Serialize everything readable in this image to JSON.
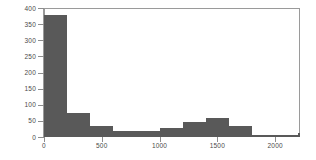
{
  "chart_data": {
    "type": "bar",
    "title": "",
    "subtitle": "",
    "xlabel": "",
    "ylabel": "",
    "grid": false,
    "legend": null,
    "orientation": "vertical",
    "histogram": true,
    "bin_width": 200,
    "xlim": [
      0,
      2215
    ],
    "ylim": [
      0,
      400
    ],
    "xticks": [
      0,
      500,
      1000,
      1500,
      2000
    ],
    "xtick_labels": [
      "0",
      "500",
      "1000",
      "1500",
      "2000"
    ],
    "yticks": [
      0,
      50,
      100,
      150,
      200,
      250,
      300,
      350,
      400
    ],
    "ytick_labels": [
      "0",
      "50",
      "100",
      "150",
      "200",
      "250",
      "300",
      "350",
      "400"
    ],
    "bin_edges": [
      0,
      200,
      400,
      600,
      800,
      1000,
      1200,
      1400,
      1600,
      1800,
      2000,
      2200
    ],
    "bars": [
      {
        "x0": 0,
        "x1": 200,
        "value": 378
      },
      {
        "x0": 200,
        "x1": 400,
        "value": 74
      },
      {
        "x0": 400,
        "x1": 600,
        "value": 34
      },
      {
        "x0": 600,
        "x1": 800,
        "value": 19
      },
      {
        "x0": 800,
        "x1": 1000,
        "value": 19
      },
      {
        "x0": 1000,
        "x1": 1200,
        "value": 28
      },
      {
        "x0": 1200,
        "x1": 1400,
        "value": 46
      },
      {
        "x0": 1400,
        "x1": 1600,
        "value": 59
      },
      {
        "x0": 1600,
        "x1": 1800,
        "value": 34
      },
      {
        "x0": 1800,
        "x1": 2000,
        "value": 5
      },
      {
        "x0": 2000,
        "x1": 2200,
        "value": 5
      },
      {
        "x0": 2200,
        "x1": 2400,
        "value": 12
      },
      {
        "x0": 2400,
        "x1": 2600,
        "value": 19
      }
    ],
    "categories": [
      "0-200",
      "200-400",
      "400-600",
      "600-800",
      "800-1000",
      "1000-1200",
      "1200-1400",
      "1400-1600",
      "1600-1800",
      "1800-2000",
      "2000-2200",
      "2200-2400",
      "2400-2600"
    ],
    "values": [
      378,
      74,
      34,
      19,
      19,
      28,
      46,
      59,
      34,
      5,
      5,
      12,
      19
    ],
    "colors": {
      "bar_fill": "#595959",
      "axis": "#9a9a9a",
      "tick_label": "#4a4a4a",
      "background": "#ffffff"
    }
  }
}
